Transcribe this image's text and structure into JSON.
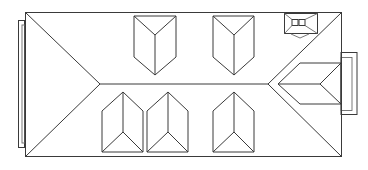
{
  "diagram": {
    "stroke_color": "#3a3a3a",
    "background": "#ffffff",
    "main_roof": {
      "x1": 25,
      "y1": 12,
      "x2": 341,
      "y2": 156,
      "ridge_y": 84,
      "ridge_x1": 100,
      "ridge_x2": 268
    },
    "left_annex": {
      "outer": [
        18,
        20,
        24,
        148
      ],
      "inner": [
        22,
        24,
        24,
        144
      ]
    },
    "right_annex": {
      "outer": [
        341,
        52,
        357,
        115
      ],
      "inner": [
        341,
        57,
        352,
        111
      ]
    },
    "dormers_top": [
      {
        "x1": 134,
        "x2": 176,
        "top": 16,
        "mid": 35,
        "bottom": 75
      },
      {
        "x1": 213,
        "x2": 254,
        "top": 16,
        "mid": 35,
        "bottom": 75
      }
    ],
    "dormers_bottom": [
      {
        "x1": 102,
        "x2": 143,
        "top": 92,
        "mid": 132,
        "bottom": 152
      },
      {
        "x1": 147,
        "x2": 188,
        "top": 92,
        "mid": 132,
        "bottom": 152
      },
      {
        "x1": 213,
        "x2": 254,
        "top": 92,
        "mid": 132,
        "bottom": 152
      }
    ],
    "chimney": {
      "x": 284,
      "y": 13,
      "w": 33,
      "h": 21
    },
    "side_dormer": {
      "tip_x": 278,
      "tip_y": 84,
      "right_x": 341,
      "top_y": 63,
      "bottom_y": 104
    }
  }
}
